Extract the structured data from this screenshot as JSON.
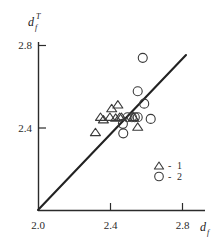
{
  "chart_data": {
    "type": "scatter",
    "title": "",
    "xlabel": "d_f",
    "ylabel": "d_f^T",
    "xlabel_base": "d",
    "xlabel_sub": "f",
    "ylabel_base": "d",
    "ylabel_sub": "f",
    "ylabel_sup": "T",
    "xlim": [
      2.0,
      2.9
    ],
    "ylim": [
      2.0,
      2.9
    ],
    "xticks": [
      2.0,
      2.4,
      2.8
    ],
    "yticks": [
      2.0,
      2.4,
      2.8
    ],
    "xtick_labels": [
      "2.0",
      "2.4",
      "2.8"
    ],
    "ytick_labels": [
      "2.0",
      "2.4",
      "2.8"
    ],
    "grid": false,
    "legend_position": "lower-right",
    "reference_line": {
      "name": "identity-line",
      "label": "y = x",
      "from": [
        2.0,
        2.0
      ],
      "to": [
        2.82,
        2.75
      ]
    },
    "series": [
      {
        "name": "1",
        "legend_label": "1",
        "marker": "triangle",
        "points": [
          [
            2.318,
            2.378
          ],
          [
            2.346,
            2.452
          ],
          [
            2.362,
            2.44
          ],
          [
            2.398,
            2.452
          ],
          [
            2.408,
            2.494
          ],
          [
            2.43,
            2.448
          ],
          [
            2.442,
            2.512
          ],
          [
            2.452,
            2.452
          ],
          [
            2.462,
            2.452
          ],
          [
            2.528,
            2.452
          ],
          [
            2.552,
            2.404
          ]
        ]
      },
      {
        "name": "2",
        "legend_label": "2",
        "marker": "circle",
        "points": [
          [
            2.47,
            2.42
          ],
          [
            2.472,
            2.374
          ],
          [
            2.496,
            2.452
          ],
          [
            2.52,
            2.452
          ],
          [
            2.536,
            2.452
          ],
          [
            2.552,
            2.452
          ],
          [
            2.552,
            2.578
          ],
          [
            2.58,
            2.74
          ],
          [
            2.588,
            2.518
          ],
          [
            2.624,
            2.444
          ]
        ]
      }
    ],
    "legend": [
      {
        "marker": "triangle",
        "separator": "-",
        "label": "1"
      },
      {
        "marker": "circle",
        "separator": "-",
        "label": "2"
      }
    ]
  }
}
